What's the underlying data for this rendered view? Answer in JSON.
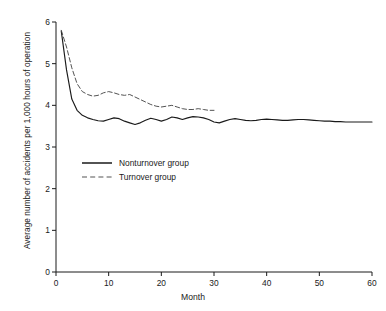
{
  "chart_data": {
    "type": "line",
    "title": "",
    "xlabel": "Month",
    "ylabel": "Average number of accidents per 1,000 hours of operation",
    "xlim": [
      0,
      60
    ],
    "ylim": [
      0,
      6
    ],
    "xticks": [
      0,
      10,
      20,
      30,
      40,
      50,
      60
    ],
    "yticks": [
      0,
      1,
      2,
      3,
      4,
      5,
      6
    ],
    "xtick_labels": [
      "0",
      "10",
      "20",
      "30",
      "40",
      "50",
      "60"
    ],
    "ytick_labels": [
      "0",
      "1",
      "2",
      "3",
      "4",
      "5",
      "6"
    ],
    "grid": false,
    "legend_position": "center-left",
    "series": [
      {
        "name": "Nonturnover group",
        "style": "solid",
        "color": "#1a1a1a",
        "x": [
          1,
          2,
          3,
          4,
          5,
          6,
          7,
          8,
          9,
          10,
          11,
          12,
          13,
          14,
          15,
          16,
          17,
          18,
          19,
          20,
          21,
          22,
          23,
          24,
          25,
          26,
          27,
          28,
          29,
          30,
          31,
          32,
          33,
          34,
          35,
          36,
          37,
          38,
          39,
          40,
          41,
          42,
          43,
          44,
          45,
          46,
          47,
          48,
          49,
          50,
          51,
          52,
          53,
          54,
          55,
          56,
          57,
          58,
          59,
          60
        ],
        "y": [
          5.78,
          4.85,
          4.15,
          3.88,
          3.76,
          3.7,
          3.66,
          3.63,
          3.62,
          3.66,
          3.7,
          3.68,
          3.62,
          3.58,
          3.54,
          3.58,
          3.64,
          3.69,
          3.66,
          3.62,
          3.66,
          3.72,
          3.7,
          3.66,
          3.7,
          3.73,
          3.72,
          3.7,
          3.66,
          3.6,
          3.58,
          3.62,
          3.66,
          3.68,
          3.66,
          3.64,
          3.63,
          3.64,
          3.66,
          3.67,
          3.66,
          3.65,
          3.64,
          3.64,
          3.65,
          3.66,
          3.66,
          3.65,
          3.64,
          3.63,
          3.62,
          3.62,
          3.61,
          3.61,
          3.6,
          3.6,
          3.6,
          3.6,
          3.6,
          3.6
        ]
      },
      {
        "name": "Turnover group",
        "style": "dashed",
        "color": "#4a4a4a",
        "x": [
          1,
          2,
          3,
          4,
          5,
          6,
          7,
          8,
          9,
          10,
          11,
          12,
          13,
          14,
          15,
          16,
          17,
          18,
          19,
          20,
          21,
          22,
          23,
          24,
          25,
          26,
          27,
          28,
          29,
          30
        ],
        "y": [
          5.8,
          5.4,
          4.9,
          4.52,
          4.33,
          4.26,
          4.22,
          4.24,
          4.3,
          4.33,
          4.3,
          4.26,
          4.24,
          4.26,
          4.2,
          4.14,
          4.08,
          4.02,
          3.98,
          3.96,
          3.98,
          4.0,
          3.96,
          3.92,
          3.9,
          3.9,
          3.92,
          3.9,
          3.88,
          3.88
        ]
      }
    ]
  },
  "legend": {
    "items": [
      {
        "label": "Nonturnover group",
        "style": "solid"
      },
      {
        "label": "Turnover group",
        "style": "dashed"
      }
    ]
  }
}
